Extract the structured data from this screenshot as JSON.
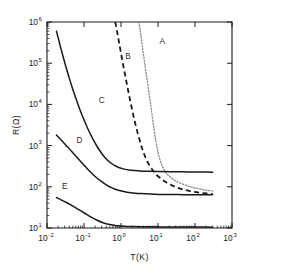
{
  "chart_data": {
    "type": "line",
    "title": "",
    "xlabel": "T(K)",
    "ylabel": "R(Ω)",
    "xscale": "log",
    "yscale": "log",
    "xlim": [
      0.01,
      1000
    ],
    "ylim": [
      10,
      1000000
    ],
    "grid": false,
    "legend_position": "inline-curve-labels",
    "xtick_labels": [
      "10⁻²",
      "10⁻¹",
      "10⁰",
      "10¹",
      "10²",
      "10³"
    ],
    "xtick_bases": [
      "10",
      "10",
      "10",
      "10",
      "10",
      "10"
    ],
    "xtick_exponents": [
      "-2",
      "-1",
      "0",
      "1",
      "2",
      "3"
    ],
    "xtick_values": [
      0.01,
      0.1,
      1,
      10,
      100,
      1000
    ],
    "ytick_labels": [
      "10¹",
      "10²",
      "10³",
      "10⁴",
      "10⁵",
      "10⁶"
    ],
    "ytick_bases": [
      "10",
      "10",
      "10",
      "10",
      "10",
      "10"
    ],
    "ytick_exponents": [
      "1",
      "2",
      "3",
      "4",
      "5",
      "6"
    ],
    "ytick_values": [
      10,
      100,
      1000,
      10000,
      100000,
      1000000
    ],
    "series": [
      {
        "name": "A",
        "label": "A",
        "style": "dotted",
        "color": "#8a8a8a",
        "label_x": 13.0,
        "label_y": 300000,
        "points": [
          [
            3.05,
            1000000
          ],
          [
            3.3,
            620000
          ],
          [
            3.6,
            360000
          ],
          [
            3.9,
            205000
          ],
          [
            4.3,
            110000
          ],
          [
            4.8,
            56000
          ],
          [
            5.4,
            27000
          ],
          [
            6.1,
            12500
          ],
          [
            6.9,
            5600
          ],
          [
            7.8,
            2500
          ],
          [
            8.8,
            1250
          ],
          [
            10.0,
            700
          ],
          [
            11.5,
            430
          ],
          [
            13.5,
            300
          ],
          [
            16.5,
            220
          ],
          [
            21.0,
            175
          ],
          [
            28.0,
            145
          ],
          [
            40.0,
            123
          ],
          [
            58.0,
            108
          ],
          [
            85.0,
            97
          ],
          [
            130.0,
            89
          ],
          [
            200.0,
            83
          ],
          [
            300.0,
            79
          ]
        ]
      },
      {
        "name": "B",
        "label": "B",
        "style": "dashed",
        "color": "#1a1a1a",
        "label_x": 1.55,
        "label_y": 125000,
        "points": [
          [
            0.7,
            1000000
          ],
          [
            0.78,
            600000
          ],
          [
            0.88,
            330000
          ],
          [
            1.0,
            175000
          ],
          [
            1.15,
            88000
          ],
          [
            1.35,
            42000
          ],
          [
            1.6,
            19500
          ],
          [
            1.92,
            8800
          ],
          [
            2.35,
            3900
          ],
          [
            2.95,
            1750
          ],
          [
            3.75,
            840
          ],
          [
            4.85,
            460
          ],
          [
            6.3,
            300
          ],
          [
            8.2,
            218
          ],
          [
            11.0,
            168
          ],
          [
            15.5,
            134
          ],
          [
            22.0,
            112
          ],
          [
            33.0,
            96
          ],
          [
            50.0,
            85
          ],
          [
            80.0,
            77
          ],
          [
            130.0,
            72
          ],
          [
            210.0,
            69
          ],
          [
            300.0,
            67
          ]
        ]
      },
      {
        "name": "C",
        "label": "C",
        "style": "solid",
        "color": "#1a1a1a",
        "label_x": 0.3,
        "label_y": 11000,
        "points": [
          [
            0.018,
            600000
          ],
          [
            0.0205,
            380000
          ],
          [
            0.0235,
            235000
          ],
          [
            0.0275,
            140000
          ],
          [
            0.0325,
            82000
          ],
          [
            0.039,
            47000
          ],
          [
            0.0475,
            26500
          ],
          [
            0.059,
            14800
          ],
          [
            0.0745,
            8200
          ],
          [
            0.096,
            4600
          ],
          [
            0.126,
            2600
          ],
          [
            0.17,
            1500
          ],
          [
            0.235,
            900
          ],
          [
            0.335,
            570
          ],
          [
            0.49,
            400
          ],
          [
            0.74,
            315
          ],
          [
            1.15,
            272
          ],
          [
            1.85,
            252
          ],
          [
            3.1,
            243
          ],
          [
            5.5,
            238
          ],
          [
            10.5,
            235
          ],
          [
            21.0,
            233
          ],
          [
            45.0,
            231
          ],
          [
            100.0,
            229
          ],
          [
            200.0,
            228
          ],
          [
            300.0,
            227
          ]
        ]
      },
      {
        "name": "D",
        "label": "D",
        "style": "solid",
        "color": "#1a1a1a",
        "label_x": 0.075,
        "label_y": 1150,
        "points": [
          [
            0.018,
            1800
          ],
          [
            0.0215,
            1520
          ],
          [
            0.026,
            1270
          ],
          [
            0.032,
            1040
          ],
          [
            0.04,
            840
          ],
          [
            0.0505,
            665
          ],
          [
            0.0645,
            520
          ],
          [
            0.0835,
            400
          ],
          [
            0.11,
            305
          ],
          [
            0.147,
            232
          ],
          [
            0.2,
            178
          ],
          [
            0.28,
            139
          ],
          [
            0.4,
            112
          ],
          [
            0.59,
            93
          ],
          [
            0.9,
            81
          ],
          [
            1.45,
            74
          ],
          [
            2.4,
            70
          ],
          [
            4.2,
            68
          ],
          [
            7.8,
            66
          ],
          [
            15.5,
            65
          ],
          [
            33.0,
            65
          ],
          [
            75.0,
            64
          ],
          [
            170.0,
            64
          ],
          [
            300.0,
            64
          ]
        ]
      },
      {
        "name": "E",
        "label": "E",
        "style": "solid",
        "color": "#1a1a1a",
        "label_x": 0.03,
        "label_y": 88,
        "points": [
          [
            0.018,
            55
          ],
          [
            0.0235,
            49
          ],
          [
            0.031,
            43
          ],
          [
            0.0415,
            37.5
          ],
          [
            0.056,
            32.0
          ],
          [
            0.077,
            27.0
          ],
          [
            0.107,
            22.5
          ],
          [
            0.152,
            18.6
          ],
          [
            0.22,
            15.6
          ],
          [
            0.325,
            13.4
          ],
          [
            0.49,
            12.1
          ],
          [
            0.76,
            11.4
          ],
          [
            1.22,
            11.05
          ],
          [
            2.05,
            10.85
          ],
          [
            3.6,
            10.75
          ],
          [
            6.6,
            10.68
          ],
          [
            13.0,
            10.62
          ],
          [
            27.0,
            10.58
          ],
          [
            60.0,
            10.55
          ],
          [
            140.0,
            10.52
          ],
          [
            300.0,
            10.5
          ]
        ]
      }
    ]
  }
}
